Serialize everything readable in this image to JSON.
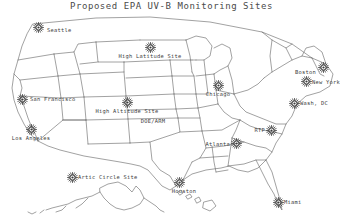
{
  "figure": {
    "title": "Proposed EPA UV-B Monitoring Sites",
    "kind": "map",
    "background_color": "#ffffff",
    "line_color": "#4a4a4a",
    "marker_color": "#3a3a3a",
    "marker_icon": "sunburst-icon"
  },
  "sites": [
    {
      "id": "seattle",
      "label": "Seattle",
      "x": 38,
      "y": 27,
      "label_x": 47,
      "label_y": 31,
      "label_pos": "right"
    },
    {
      "id": "high-latitude-site",
      "label": "High Latitude Site",
      "x": 150,
      "y": 47,
      "label_x": 150,
      "label_y": 54,
      "label_pos": "below"
    },
    {
      "id": "boston",
      "label": "Boston",
      "x": 323,
      "y": 67,
      "label_x": 316,
      "label_y": 73,
      "label_pos": "left"
    },
    {
      "id": "new-york",
      "label": "New York",
      "x": 306,
      "y": 81,
      "label_x": 312,
      "label_y": 83,
      "label_pos": "right"
    },
    {
      "id": "chicago",
      "label": "Chicago",
      "x": 218,
      "y": 85,
      "label_x": 218,
      "label_y": 92,
      "label_pos": "below"
    },
    {
      "id": "san-francisco",
      "label": "San Francisco",
      "x": 22,
      "y": 99,
      "label_x": 30,
      "label_y": 100,
      "label_pos": "right"
    },
    {
      "id": "high-altitude-site",
      "label": "High Altitude Site",
      "x": 127,
      "y": 102,
      "label_x": 127,
      "label_y": 109,
      "label_pos": "below"
    },
    {
      "id": "washington-dc",
      "label": "Wash, DC",
      "x": 294,
      "y": 103,
      "label_x": 300,
      "label_y": 104,
      "label_pos": "right"
    },
    {
      "id": "los-angeles",
      "label": "Los Angeles",
      "x": 31,
      "y": 129,
      "label_x": 31,
      "label_y": 136,
      "label_pos": "below"
    },
    {
      "id": "rtp",
      "label": "RTP",
      "x": 271,
      "y": 130,
      "label_x": 265,
      "label_y": 131,
      "label_pos": "left"
    },
    {
      "id": "atlanta",
      "label": "Atlanta",
      "x": 236,
      "y": 143,
      "label_x": 230,
      "label_y": 145,
      "label_pos": "left"
    },
    {
      "id": "houston",
      "label": "Houston",
      "x": 179,
      "y": 182,
      "label_x": 184,
      "label_y": 189,
      "label_pos": "below"
    },
    {
      "id": "arctic-circle-site",
      "label": "Artic Circle Site",
      "x": 72,
      "y": 177,
      "label_x": 78,
      "label_y": 178,
      "label_pos": "right"
    },
    {
      "id": "miami",
      "label": "Miami",
      "x": 278,
      "y": 202,
      "label_x": 284,
      "label_y": 203,
      "label_pos": "right"
    }
  ],
  "annotations": [
    {
      "id": "doe-arm",
      "label": "DOE/ARM",
      "x": 153,
      "y": 118
    }
  ],
  "insets": [
    {
      "id": "alaska-inset",
      "label": "Alaska"
    },
    {
      "id": "hawaii-inset",
      "label": "Hawaii"
    }
  ]
}
